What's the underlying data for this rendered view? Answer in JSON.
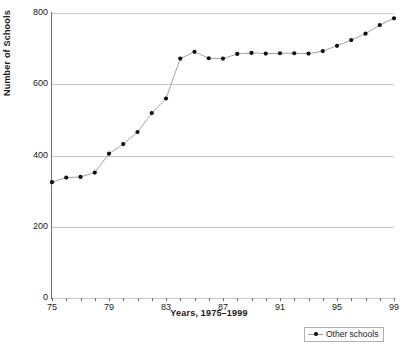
{
  "chart_data": {
    "type": "line",
    "title": "",
    "xlabel": "Years, 1975–1999",
    "ylabel": "Number of Schools",
    "xlim": [
      75,
      99
    ],
    "ylim": [
      0,
      800
    ],
    "grid": true,
    "legend_position": "bottom-right",
    "y_ticks": [
      0,
      200,
      400,
      600,
      800
    ],
    "y_tick_labels": [
      "0",
      "200",
      "400",
      "600",
      "800"
    ],
    "x_ticks": [
      75,
      76,
      77,
      78,
      79,
      80,
      81,
      82,
      83,
      84,
      85,
      86,
      87,
      88,
      89,
      90,
      91,
      92,
      93,
      94,
      95,
      96,
      97,
      98,
      99
    ],
    "x_tick_labels_shown": [
      "75",
      "79",
      "83",
      "87",
      "91",
      "95",
      "99"
    ],
    "x_labeled_ticks": [
      75,
      79,
      83,
      87,
      91,
      95,
      99
    ],
    "series": [
      {
        "name": "Other schools",
        "color": "#111111",
        "line_color": "#9a9a9a",
        "marker": "dot",
        "x": [
          75,
          76,
          77,
          78,
          79,
          80,
          81,
          82,
          83,
          84,
          85,
          86,
          87,
          88,
          89,
          90,
          91,
          92,
          93,
          94,
          95,
          96,
          97,
          98,
          99
        ],
        "values": [
          325,
          338,
          340,
          352,
          405,
          432,
          466,
          519,
          560,
          672,
          691,
          673,
          672,
          685,
          688,
          686,
          687,
          687,
          686,
          693,
          708,
          724,
          742,
          766,
          785
        ]
      }
    ]
  },
  "legend": {
    "entries": [
      {
        "label": "Other schools"
      }
    ]
  }
}
